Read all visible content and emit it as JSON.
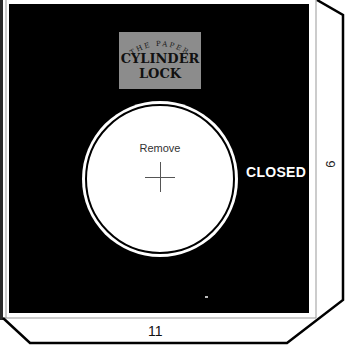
{
  "label": {
    "arc_text": "THE PAPER",
    "title_line1": "CYLINDER",
    "title_line2": "LOCK"
  },
  "dial": {
    "remove_text": "Remove"
  },
  "status": {
    "closed_text": "CLOSED"
  },
  "tabs": {
    "right_number": "9",
    "bottom_number": "11"
  },
  "colors": {
    "panel": "#000000",
    "label_box": "#8c8c8c",
    "dial": "#ffffff"
  }
}
